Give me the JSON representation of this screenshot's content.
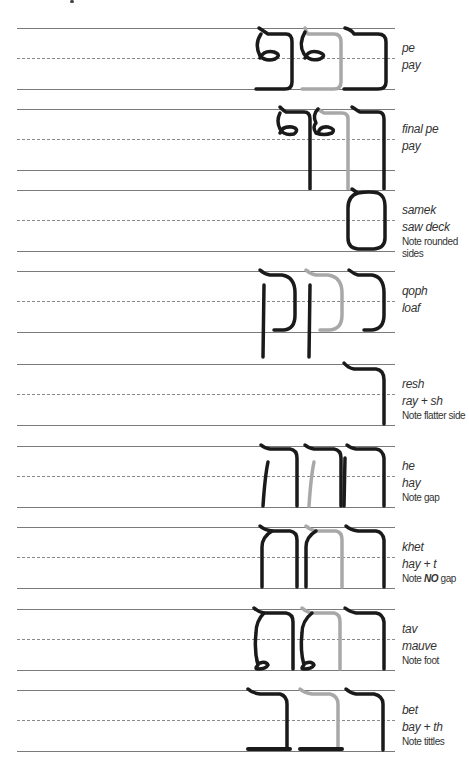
{
  "colors": {
    "ink": "#1a1a1a",
    "guide": "#a8a8a8",
    "rule": "#7a7a7a"
  },
  "rows": [
    {
      "name": "pe",
      "sound": "pay",
      "note": ""
    },
    {
      "name": "final pe",
      "sound": "pay",
      "note": ""
    },
    {
      "name": "samek",
      "sound": "saw deck",
      "note": "Note rounded sides"
    },
    {
      "name": "qoph",
      "sound": "loaf",
      "note": ""
    },
    {
      "name": "resh",
      "sound": "ray + sh",
      "note": "Note flatter side"
    },
    {
      "name": "he",
      "sound": "hay",
      "note": "Note gap"
    },
    {
      "name": "khet",
      "sound": "hay + t",
      "note_prefix": "Note ",
      "note_emph": "NO",
      "note_suffix": " gap"
    },
    {
      "name": "tav",
      "sound": "mauve",
      "note": "Note foot"
    },
    {
      "name": "bet",
      "sound": "bay + th",
      "note": "Note tittles"
    }
  ]
}
